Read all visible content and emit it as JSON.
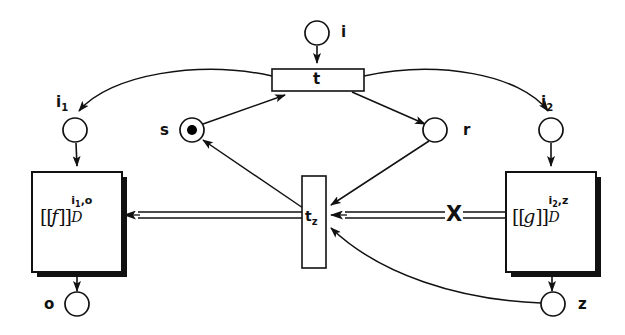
{
  "figure": {
    "type": "petri-net",
    "title": "",
    "colors": {
      "stroke": "#111111",
      "fill": "#ffffff",
      "token": "#000000",
      "shadow": "#111111",
      "background": "#ffffff"
    }
  },
  "places": [
    {
      "id": "i",
      "label": "i",
      "label_html": "i",
      "cx": 317,
      "cy": 33,
      "r": 12,
      "token": false,
      "label_x": 341,
      "label_y": 25
    },
    {
      "id": "i1",
      "label": "i1",
      "label_html": "i<sub>1</sub>",
      "cx": 75,
      "cy": 130,
      "r": 12,
      "token": false,
      "label_x": 56,
      "label_y": 95
    },
    {
      "id": "i2",
      "label": "i2",
      "label_html": "i<sub>2</sub>",
      "cx": 551,
      "cy": 130,
      "r": 12,
      "token": false,
      "label_x": 541,
      "label_y": 95
    },
    {
      "id": "s",
      "label": "s",
      "label_html": "s",
      "cx": 192,
      "cy": 130,
      "r": 12,
      "token": true,
      "label_x": 160,
      "label_y": 123
    },
    {
      "id": "r",
      "label": "r",
      "label_html": "r",
      "cx": 435,
      "cy": 130,
      "r": 12,
      "token": false,
      "label_x": 463,
      "label_y": 123
    },
    {
      "id": "o",
      "label": "o",
      "label_html": "o",
      "cx": 77,
      "cy": 304,
      "r": 12,
      "token": false,
      "label_x": 44,
      "label_y": 297
    },
    {
      "id": "z",
      "label": "z",
      "label_html": "z",
      "cx": 553,
      "cy": 304,
      "r": 12,
      "token": false,
      "label_x": 578,
      "label_y": 297
    }
  ],
  "transitions": [
    {
      "id": "t",
      "label": "t",
      "label_html": "t",
      "x": 272,
      "y": 69,
      "w": 92,
      "h": 22,
      "orientation": "horizontal",
      "label_x": 312,
      "label_y": 72
    },
    {
      "id": "tz",
      "label": "tz",
      "label_html": "t<sub>z</sub>",
      "x": 302,
      "y": 176,
      "w": 24,
      "h": 92,
      "orientation": "vertical",
      "label_x": 305,
      "label_y": 209
    }
  ],
  "boxes": [
    {
      "id": "f-box",
      "x": 32,
      "y": 172,
      "w": 90,
      "h": 100,
      "function": "f",
      "open_bracket": "[",
      "close_bracket": "]",
      "superscript": "i1,o",
      "superscript_html": "i<sub>1</sub>,o",
      "subscript": "D",
      "label_x": 40,
      "label_y": 213
    },
    {
      "id": "g-box",
      "x": 506,
      "y": 172,
      "w": 90,
      "h": 100,
      "function": "g",
      "open_bracket": "[",
      "close_bracket": "]",
      "superscript": "i2,z",
      "superscript_html": "i<sub>2</sub>,z",
      "subscript": "D",
      "label_x": 512,
      "label_y": 213
    }
  ],
  "markings": [
    {
      "id": "x-mark",
      "symbol": "X",
      "x": 445,
      "y": 205,
      "on_arc": "g-box-to-tz"
    }
  ],
  "arcs": [
    {
      "id": "i-to-t",
      "from": "i",
      "to": "t",
      "kind": "single",
      "style": "straight"
    },
    {
      "id": "t-to-i1",
      "from": "t",
      "to": "i1",
      "kind": "single",
      "style": "curved"
    },
    {
      "id": "t-to-i2",
      "from": "t",
      "to": "i2",
      "kind": "single",
      "style": "curved"
    },
    {
      "id": "t-to-r",
      "from": "t",
      "to": "r",
      "kind": "single",
      "style": "straight"
    },
    {
      "id": "s-to-t",
      "from": "s",
      "to": "t",
      "kind": "single",
      "style": "straight"
    },
    {
      "id": "i1-to-fbox",
      "from": "i1",
      "to": "f-box",
      "kind": "single",
      "style": "straight"
    },
    {
      "id": "i2-to-gbox",
      "from": "i2",
      "to": "g-box",
      "kind": "single",
      "style": "straight"
    },
    {
      "id": "fbox-to-o",
      "from": "f-box",
      "to": "o",
      "kind": "single",
      "style": "straight"
    },
    {
      "id": "gbox-to-z",
      "from": "g-box",
      "to": "z",
      "kind": "single",
      "style": "straight"
    },
    {
      "id": "tz-to-s",
      "from": "tz",
      "to": "s",
      "kind": "single",
      "style": "straight"
    },
    {
      "id": "r-to-tz",
      "from": "r",
      "to": "tz",
      "kind": "single",
      "style": "straight"
    },
    {
      "id": "z-to-tz",
      "from": "z",
      "to": "tz",
      "kind": "single",
      "style": "curved"
    },
    {
      "id": "tz-to-fbox",
      "from": "tz",
      "to": "f-box",
      "kind": "double",
      "style": "straight"
    },
    {
      "id": "gbox-to-tz",
      "from": "g-box",
      "to": "tz",
      "kind": "double",
      "style": "straight"
    }
  ]
}
